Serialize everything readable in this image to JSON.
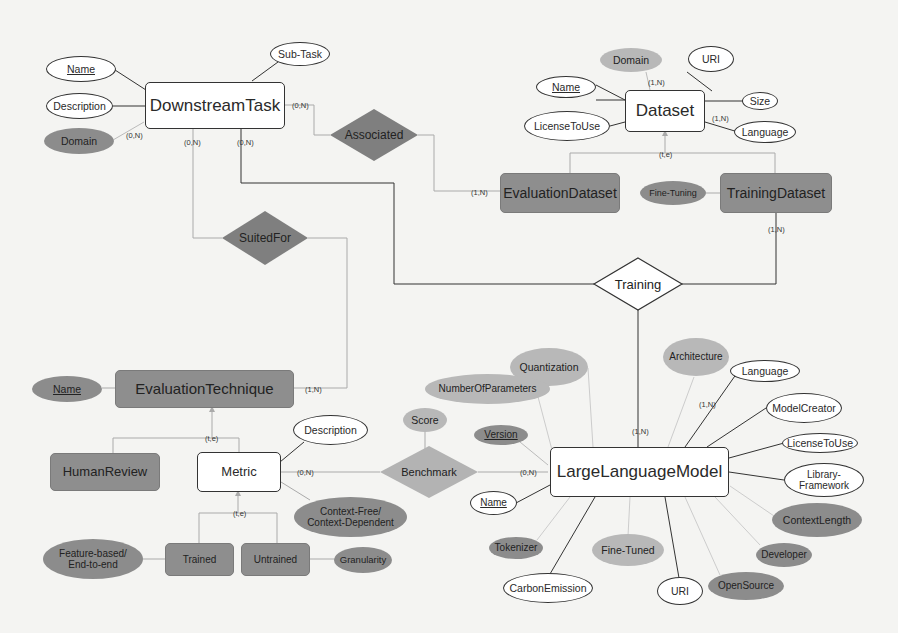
{
  "diagram": {
    "type": "entity-relationship",
    "entities": {
      "downstream_task": "DownstreamTask",
      "dataset": "Dataset",
      "evaluation_dataset": "EvaluationDataset",
      "training_dataset": "TrainingDataset",
      "evaluation_technique": "EvaluationTechnique",
      "human_review": "HumanReview",
      "metric": "Metric",
      "trained": "Trained",
      "untrained": "Untrained",
      "large_language_model": "LargeLanguageModel"
    },
    "relationships": {
      "associated": "Associated",
      "suited_for": "SuitedFor",
      "training": "Training",
      "benchmark": "Benchmark"
    },
    "attributes": {
      "task_name": "Name",
      "task_description": "Description",
      "task_domain": "Domain",
      "task_subtask": "Sub-Task",
      "ds_domain": "Domain",
      "ds_uri": "URI",
      "ds_name": "Name",
      "ds_size": "Size",
      "ds_license": "LicenseToUse",
      "ds_language": "Language",
      "fine_tuning": "Fine-Tuning",
      "et_name": "Name",
      "metric_description": "Description",
      "context": "Context-Free/\nContext-Dependent",
      "feature_based": "Feature-based/\nEnd-to-end",
      "granularity": "Granularity",
      "score": "Score",
      "quantization": "Quantization",
      "architecture": "Architecture",
      "num_params": "NumberOfParameters",
      "llm_language": "Language",
      "model_creator": "ModelCreator",
      "llm_license": "LicenseToUse",
      "library": "Library-\nFramework",
      "context_length": "ContextLength",
      "developer": "Developer",
      "open_source": "OpenSource",
      "llm_uri": "URI",
      "fine_tuned": "Fine-Tuned",
      "carbon": "CarbonEmission",
      "tokenizer": "Tokenizer",
      "llm_name": "Name",
      "version": "Version"
    },
    "cardinalities": {
      "task_domain": "(0,N)",
      "task_suited": "(0,N)",
      "task_training": "(0,N)",
      "task_associated": "(0,N)",
      "ds_domain": "(1,N)",
      "ds_language": "(1,N)",
      "ds_spec": "(t,e)",
      "evalds_associated": "(1,N)",
      "trainds_training": "(1,N)",
      "et_suited": "(1,N)",
      "et_spec": "(t,e)",
      "metric_spec": "(t,e)",
      "metric_benchmark": "(0,N)",
      "llm_benchmark": "(0,N)",
      "llm_training": "(1,N)",
      "llm_language": "(1,N)"
    },
    "colors": {
      "strong_entity_fill": "#ffffff",
      "sub_entity_fill": "#8e8e8e",
      "relationship_dark": "#7f7f7f",
      "relationship_light": "#b3b3b3",
      "attr_dark": "#8c8c8c",
      "attr_light": "#b8b8b8",
      "line": "#333333",
      "line_light": "#b0b0b0"
    }
  }
}
